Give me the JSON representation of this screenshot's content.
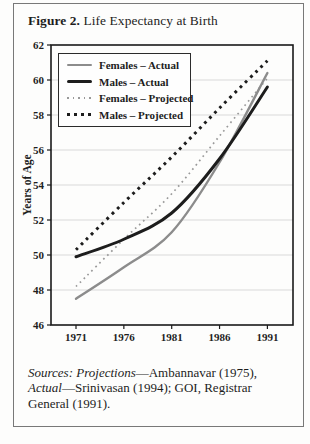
{
  "figure": {
    "title_parts": [
      {
        "text": "Figure 2.",
        "bold": true
      },
      {
        "text": " Life Expectancy at Birth",
        "bold": false
      }
    ],
    "sources_parts": [
      {
        "text": "Sources: Projections",
        "italic": true
      },
      {
        "text": "—Ambannavar (1975), ",
        "italic": false
      },
      {
        "text": "Actual",
        "italic": true
      },
      {
        "text": "—Srinivasan (1994); GOI, Registrar General (1991).",
        "italic": false
      }
    ]
  },
  "chart_data": {
    "type": "line",
    "title": "Figure 2. Life Expectancy at Birth",
    "xlabel": "",
    "ylabel": "Years of Age",
    "x": [
      1971,
      1976,
      1981,
      1986,
      1991
    ],
    "xticks": [
      "1971",
      "1976",
      "1981",
      "1986",
      "1991"
    ],
    "yticks": [
      46,
      48,
      50,
      52,
      54,
      56,
      58,
      60,
      62
    ],
    "ylim": [
      46,
      62
    ],
    "grid": true,
    "legend_position": "top-left",
    "colors": {
      "gray": "#8c8c8c",
      "black": "#1d1d1d",
      "grid": "#d9d9d9",
      "axis": "#1a1a1a"
    },
    "series": [
      {
        "name": "Females – Actual",
        "style": "solid",
        "color": "#8c8c8c",
        "width": 2.4,
        "values": [
          47.5,
          49.3,
          51.3,
          55.3,
          60.4
        ]
      },
      {
        "name": "Males – Actual",
        "style": "solid",
        "color": "#1d1d1d",
        "width": 3.0,
        "values": [
          49.9,
          50.9,
          52.4,
          55.5,
          59.6
        ]
      },
      {
        "name": "Females – Projected",
        "style": "dotted",
        "color": "#999999",
        "width": 1.7,
        "values": [
          48.2,
          50.9,
          53.5,
          56.8,
          60.1
        ]
      },
      {
        "name": "Males –  Projected",
        "style": "dotted",
        "color": "#1d1d1d",
        "width": 3.0,
        "values": [
          50.3,
          53.0,
          55.6,
          58.4,
          61.1
        ]
      }
    ]
  }
}
